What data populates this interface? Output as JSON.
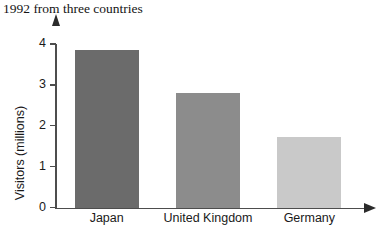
{
  "chart_data": {
    "type": "bar",
    "title": "1992 from three countries",
    "xlabel": "",
    "ylabel": "Visitors (millions)",
    "categories": [
      "Japan",
      "United Kingdom",
      "Germany"
    ],
    "values": [
      3.85,
      2.8,
      1.73
    ],
    "ylim": [
      0,
      4.2
    ],
    "yticks": [
      0,
      1,
      2,
      3,
      4
    ],
    "ytick_labels": [
      "0",
      "1",
      "2",
      "3",
      "4"
    ],
    "grid": false,
    "legend": false,
    "bar_colors": [
      "#6b6b6b",
      "#8c8c8c",
      "#c9c9c9"
    ],
    "axis_color": "#4d4d4d",
    "axis_has_arrowheads": true
  },
  "axes": {
    "y_arrow_icon": "up-arrow-icon",
    "x_arrow_icon": "right-arrow-icon"
  }
}
